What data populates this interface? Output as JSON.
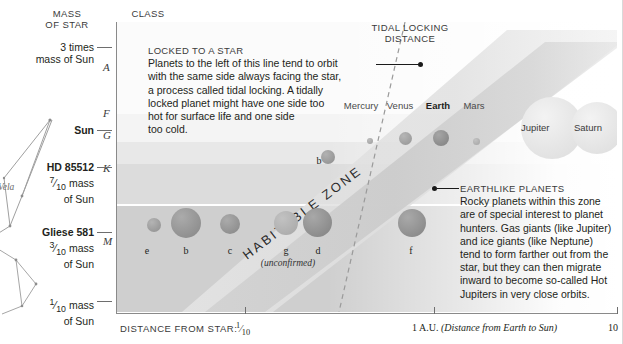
{
  "axes": {
    "y_header": "MASS\nOF STAR",
    "y_header_line1": "MASS",
    "y_header_line2": "OF STAR",
    "class_header_line1": "CLASS",
    "class_header_line2": "OF STAR",
    "y_ticks": [
      {
        "line1": "3 times",
        "line2": "mass of Sun",
        "bold": false
      },
      {
        "line1": "Sun",
        "line2": "",
        "bold": true
      },
      {
        "line1": "HD 85512",
        "line2": "7/10 mass",
        "line3": "of Sun",
        "bold": true
      },
      {
        "line1": "Gliese 581",
        "line2": "3/10 mass",
        "line3": "of Sun",
        "bold": true
      },
      {
        "line1": "1/10 mass",
        "line2": "of Sun",
        "bold": false
      }
    ],
    "class_letters": [
      "A",
      "F",
      "G",
      "K",
      "M"
    ],
    "x_caption": "DISTANCE FROM STAR:",
    "x_ticks": [
      {
        "label": "1/10",
        "note": ""
      },
      {
        "label": "1 A.U.",
        "note": "(Distance from Earth to Sun)"
      },
      {
        "label": "10",
        "note": ""
      }
    ]
  },
  "zone": {
    "label": "HABITABLE ZONE"
  },
  "tidal": {
    "label_line1": "TIDAL LOCKING",
    "label_line2": "DISTANCE"
  },
  "callouts": {
    "locked": {
      "heading": "LOCKED TO A STAR",
      "body": "Planets to the left of this line tend to orbit with the same side always facing the star, a process called tidal locking. A tidally locked planet might have one side too hot for surface life and one side too cold.",
      "lines": [
        "Planets to the left of this line tend to orbit",
        "with the same side always facing the star,",
        "a process called tidal locking. A tidally",
        "locked planet might have one side too",
        "hot for surface life and one side",
        "too cold."
      ]
    },
    "earthlike": {
      "heading": "EARTHLIKE PLANETS",
      "body": "Rocky planets within this zone are of special interest to planet hunters. Gas giants (like Jupiter) and ice giants (like Neptune) tend to form farther out from the star, but they can then migrate inward to become so-called Hot Jupiters in very close orbits.",
      "lines": [
        "Rocky planets within this zone",
        "are of special interest to planet",
        "hunters. Gas giants (like Jupiter)",
        "and ice giants (like Neptune)",
        "tend to form farther out from the",
        "star, but they can then migrate",
        "inward to become so-called Hot",
        "Jupiters in very close orbits."
      ]
    }
  },
  "solar_planets": [
    {
      "name": "Mercury",
      "bold": false
    },
    {
      "name": "Venus",
      "bold": false
    },
    {
      "name": "Earth",
      "bold": true
    },
    {
      "name": "Mars",
      "bold": false
    }
  ],
  "gas_giants": [
    {
      "name": "Jupiter"
    },
    {
      "name": "Saturn"
    }
  ],
  "gliese_planets": [
    {
      "label": "e",
      "note": ""
    },
    {
      "label": "b",
      "note": ""
    },
    {
      "label": "c",
      "note": ""
    },
    {
      "label": "g",
      "note": "(unconfirmed)"
    },
    {
      "label": "d",
      "note": ""
    },
    {
      "label": "f",
      "note": ""
    }
  ],
  "hd_planets": [
    {
      "label": "b"
    }
  ],
  "constellation": {
    "label": "Vela"
  },
  "colors": {
    "band_a": "#fbfbfb",
    "band_f": "#f4f4f4",
    "band_g": "#e8e8e8",
    "band_k": "#dcdcdc",
    "band_m": "#cfcfcf",
    "habitable_zone": "#c9c9c9",
    "planet_body": "#9a9a9a",
    "text": "#231f20"
  }
}
